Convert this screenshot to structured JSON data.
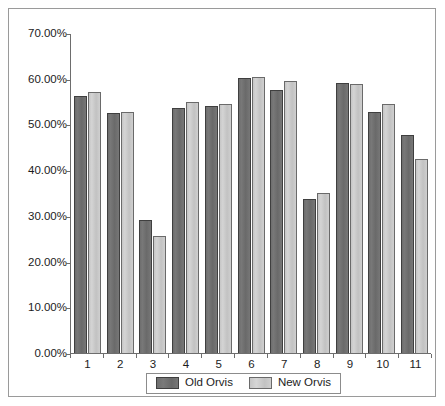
{
  "chart_data": {
    "type": "bar",
    "title": "",
    "subtitle": "",
    "xlabel": "",
    "ylabel": "",
    "categories": [
      "1",
      "2",
      "3",
      "4",
      "5",
      "6",
      "7",
      "8",
      "9",
      "10",
      "11"
    ],
    "series": [
      {
        "name": "Old Orvis",
        "color": "#707070",
        "values": [
          56.2,
          52.4,
          29.1,
          53.6,
          54.0,
          60.2,
          57.5,
          33.8,
          59.0,
          52.8,
          47.8
        ]
      },
      {
        "name": "New Orvis",
        "color": "#c8c8c8",
        "values": [
          57.0,
          52.7,
          25.7,
          55.0,
          54.5,
          60.4,
          59.6,
          35.0,
          58.8,
          54.4,
          42.4
        ]
      }
    ],
    "ylim": [
      0,
      70
    ],
    "ytick_values": [
      0,
      10,
      20,
      30,
      40,
      50,
      60,
      70
    ],
    "ytick_labels": [
      "0.00%",
      "10.00%",
      "20.00%",
      "30.00%",
      "40.00%",
      "50.00%",
      "60.00%",
      "70.00%"
    ],
    "grid": false,
    "legend_position": "bottom"
  },
  "legend": {
    "entries": [
      {
        "label": "Old Orvis",
        "swatch": "old"
      },
      {
        "label": "New Orvis",
        "swatch": "new"
      }
    ]
  },
  "colors": {
    "series_old": "#707070",
    "series_new": "#c8c8c8",
    "axis": "#6d6d6d",
    "frame": "#9a9a9a",
    "text": "#1c1c1c",
    "background": "#ffffff"
  }
}
